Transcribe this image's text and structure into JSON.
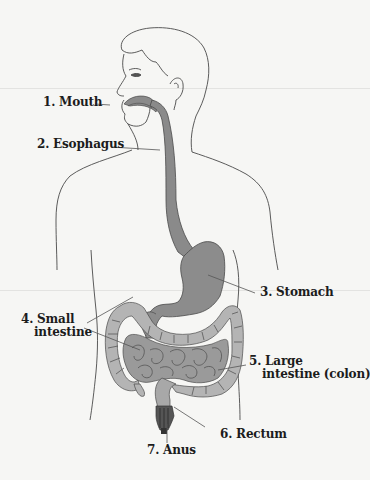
{
  "diagram": {
    "colors": {
      "background": "#f6f6f4",
      "outline": "#4a4a4a",
      "organ_dark": "#8a8a8a",
      "organ_mid": "#9c9c9c",
      "organ_light": "#b8b8b8",
      "leader_line": "#555555",
      "label_text": "#1c1c1c"
    },
    "labels": [
      {
        "id": "mouth",
        "number": "1.",
        "line1": "1. Mouth",
        "line2": ""
      },
      {
        "id": "esophagus",
        "number": "2.",
        "line1": "2. Esophagus",
        "line2": ""
      },
      {
        "id": "stomach",
        "number": "3.",
        "line1": "3. Stomach",
        "line2": ""
      },
      {
        "id": "small-intestine",
        "number": "4.",
        "line1": "4. Small",
        "line2": "intestine"
      },
      {
        "id": "large-intestine",
        "number": "5.",
        "line1": "5. Large",
        "line2": "intestine (colon)"
      },
      {
        "id": "rectum",
        "number": "6.",
        "line1": "6. Rectum",
        "line2": ""
      },
      {
        "id": "anus",
        "number": "7.",
        "line1": "7. Anus",
        "line2": ""
      }
    ]
  }
}
